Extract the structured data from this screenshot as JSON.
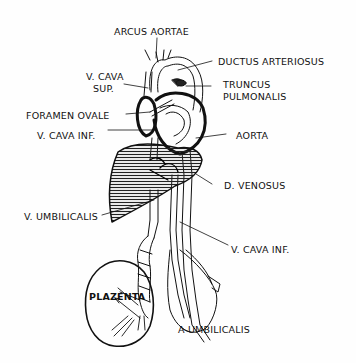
{
  "diagram": {
    "type": "anatomical-illustration",
    "colors": {
      "ink": "#111111",
      "background": "#fefefe",
      "hatch": "#333333"
    },
    "labels": {
      "arcus_aortae": "ARCUS AORTAE",
      "ductus_arteriosus": "DUCTUS ARTERIOSUS",
      "v_cava_sup_line1": "V. CAVA",
      "v_cava_sup_line2": "SUP.",
      "truncus_line1": "TRUNCUS",
      "truncus_line2": "PULMONALIS",
      "foramen_ovale": "FORAMEN OVALE",
      "v_cava_inf_upper": "V. CAVA INF.",
      "aorta": "AORTA",
      "d_venosus": "D. VENOSUS",
      "v_umbilicalis": "V. UMBILICALIS",
      "v_cava_inf_lower": "V. CAVA   INF.",
      "plazenta": "PLAZENTA",
      "a_umbilicalis": "A UMBILICALIS"
    }
  }
}
